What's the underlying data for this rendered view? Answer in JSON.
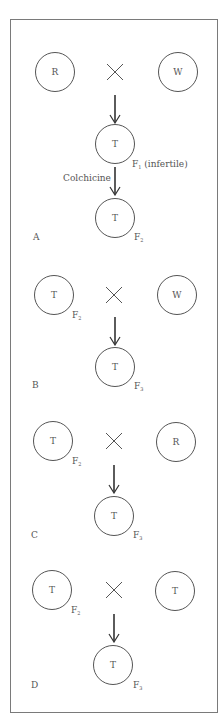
{
  "diagram": {
    "sections": [
      {
        "label": "A",
        "parent_left": "R",
        "parent_right": "W",
        "cross_symbol": "×",
        "f1": {
          "text": "T",
          "gen": "F",
          "gen_sub": "1",
          "note": "(infertile)"
        },
        "treatment": "Colchicine",
        "offspring": {
          "text": "T",
          "gen": "F",
          "gen_sub": "2"
        }
      },
      {
        "label": "B",
        "parent_left": "T",
        "parent_left_gen": "F",
        "parent_left_sub": "2",
        "parent_right": "W",
        "offspring": {
          "text": "T",
          "gen": "F",
          "gen_sub": "3"
        }
      },
      {
        "label": "C",
        "parent_left": "T",
        "parent_left_gen": "F",
        "parent_left_sub": "2",
        "parent_right": "R",
        "offspring": {
          "text": "T",
          "gen": "F",
          "gen_sub": "3"
        }
      },
      {
        "label": "D",
        "parent_left": "T",
        "parent_left_gen": "F",
        "parent_left_sub": "2",
        "parent_right": "T",
        "offspring": {
          "text": "T",
          "gen": "F",
          "gen_sub": "3"
        }
      }
    ],
    "colors": {
      "line": "#555555",
      "frame": "#7a7a7a",
      "text": "#555555"
    }
  }
}
